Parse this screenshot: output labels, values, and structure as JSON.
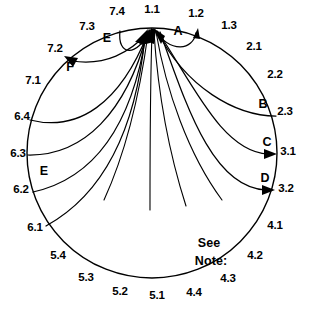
{
  "diagram": {
    "type": "circular-node-flow",
    "title": "",
    "circle": {
      "cx": 152,
      "cy": 153,
      "r": 125
    },
    "hub_node": "1.1",
    "note": {
      "line1": "See",
      "line2": "Note:"
    },
    "nodes": [
      {
        "id": "1.1",
        "label": "1.1",
        "x": 152,
        "y": 10,
        "align": "center"
      },
      {
        "id": "1.2",
        "label": "1.2",
        "x": 196,
        "y": 14,
        "align": "center"
      },
      {
        "id": "1.3",
        "label": "1.3",
        "x": 229,
        "y": 26,
        "align": "center"
      },
      {
        "id": "2.1",
        "label": "2.1",
        "x": 254,
        "y": 47,
        "align": "center"
      },
      {
        "id": "2.2",
        "label": "2.2",
        "x": 275,
        "y": 75,
        "align": "center"
      },
      {
        "id": "2.3",
        "label": "2.3",
        "x": 285,
        "y": 112,
        "align": "center"
      },
      {
        "id": "3.1",
        "label": "3.1",
        "x": 288,
        "y": 152,
        "align": "center"
      },
      {
        "id": "3.2",
        "label": "3.2",
        "x": 286,
        "y": 189,
        "align": "center"
      },
      {
        "id": "4.1",
        "label": "4.1",
        "x": 275,
        "y": 226,
        "align": "center"
      },
      {
        "id": "4.2",
        "label": "4.2",
        "x": 255,
        "y": 256,
        "align": "center"
      },
      {
        "id": "4.3",
        "label": "4.3",
        "x": 228,
        "y": 279,
        "align": "center"
      },
      {
        "id": "4.4",
        "label": "4.4",
        "x": 194,
        "y": 293,
        "align": "center"
      },
      {
        "id": "5.1",
        "label": "5.1",
        "x": 157,
        "y": 296,
        "align": "center"
      },
      {
        "id": "5.2",
        "label": "5.2",
        "x": 120,
        "y": 292,
        "align": "center"
      },
      {
        "id": "5.3",
        "label": "5.3",
        "x": 86,
        "y": 278,
        "align": "center"
      },
      {
        "id": "5.4",
        "label": "5.4",
        "x": 58,
        "y": 256,
        "align": "center"
      },
      {
        "id": "6.1",
        "label": "6.1",
        "x": 35,
        "y": 228,
        "align": "center"
      },
      {
        "id": "6.2",
        "label": "6.2",
        "x": 21,
        "y": 190,
        "align": "center"
      },
      {
        "id": "6.3",
        "label": "6.3",
        "x": 18,
        "y": 154,
        "align": "center"
      },
      {
        "id": "6.4",
        "label": "6.4",
        "x": 22,
        "y": 117,
        "align": "center"
      },
      {
        "id": "7.1",
        "label": "7.1",
        "x": 33,
        "y": 81,
        "align": "center"
      },
      {
        "id": "7.2",
        "label": "7.2",
        "x": 55,
        "y": 49,
        "align": "center"
      },
      {
        "id": "7.3",
        "label": "7.3",
        "x": 87,
        "y": 27,
        "align": "center"
      },
      {
        "id": "7.4",
        "label": "7.4",
        "x": 117,
        "y": 12,
        "align": "center"
      }
    ],
    "edges": [
      {
        "id": "A",
        "label": "A",
        "from": "1.1",
        "to": "1.2",
        "label_x": 178,
        "label_y": 31,
        "arrow": "to"
      },
      {
        "id": "E-top",
        "label": "E",
        "from": "1.1",
        "to": "7.4",
        "label_x": 107,
        "label_y": 38,
        "arrow": "none"
      },
      {
        "id": "F",
        "label": "F",
        "from": "1.1",
        "to": "7.2",
        "label_x": 70,
        "label_y": 67,
        "arrow": "to"
      },
      {
        "id": "B",
        "label": "B",
        "from": "2.3",
        "to": "1.1",
        "label_x": 263,
        "label_y": 104,
        "arrow": "to-hub"
      },
      {
        "id": "C",
        "label": "C",
        "from": "1.1",
        "to": "3.1",
        "label_x": 267,
        "label_y": 142,
        "arrow": "to"
      },
      {
        "id": "D",
        "label": "D",
        "from": "1.1",
        "to": "3.2",
        "label_x": 265,
        "label_y": 178,
        "arrow": "to"
      },
      {
        "id": "E-left",
        "label": "E",
        "from": "6.2",
        "to": "1.1",
        "label_x": 44,
        "label_y": 171,
        "arrow": "to-hub"
      },
      {
        "id": "in-6.4",
        "label": "",
        "from": "6.4",
        "to": "1.1",
        "label_x": 0,
        "label_y": 0,
        "arrow": "to-hub"
      },
      {
        "id": "in-6.3",
        "label": "",
        "from": "6.3",
        "to": "1.1",
        "label_x": 0,
        "label_y": 0,
        "arrow": "to-hub"
      },
      {
        "id": "in-6.1",
        "label": "",
        "from": "6.1",
        "to": "1.1",
        "label_x": 0,
        "label_y": 0,
        "arrow": "to-hub"
      }
    ]
  }
}
